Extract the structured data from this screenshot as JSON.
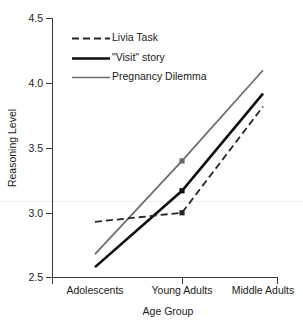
{
  "chart_data": {
    "type": "line",
    "title": "",
    "xlabel": "Age Group",
    "ylabel": "Reasoning Level",
    "categories": [
      "Adolescents",
      "Young Adults",
      "Middle Adults"
    ],
    "ylim": [
      2.5,
      4.5
    ],
    "yticks": [
      "2.5",
      "3.0",
      "3.5",
      "4.0",
      "4.5"
    ],
    "ytick_values": [
      2.5,
      3.0,
      3.5,
      4.0,
      4.5
    ],
    "grid": false,
    "legend_position": "upper left",
    "series": [
      {
        "name": "Livia Task",
        "style": "dashed",
        "color": "#262626",
        "width": 1.8,
        "markers": true,
        "values": [
          2.93,
          3.0,
          3.82
        ]
      },
      {
        "name": "\"Visit\" story",
        "style": "solid",
        "color": "#0d0d0d",
        "width": 2.6,
        "markers": true,
        "values": [
          2.58,
          3.17,
          3.92
        ]
      },
      {
        "name": "Pregnancy Dilemma",
        "style": "solid",
        "color": "#6b6b6b",
        "width": 1.7,
        "markers": true,
        "values": [
          2.68,
          3.4,
          4.1
        ]
      }
    ]
  },
  "axes": {
    "y_title": "Reasoning Level",
    "x_title": "Age Group",
    "y_tick_labels": [
      "4.5",
      "4.0",
      "3.5",
      "3.0",
      "2.5"
    ],
    "x_tick_labels": [
      "Adolescents",
      "Young Adults",
      "Middle Adults"
    ]
  },
  "legend": {
    "items": [
      {
        "label": "Livia Task"
      },
      {
        "label": "\"Visit\" story"
      },
      {
        "label": "Pregnancy Dilemma"
      }
    ]
  }
}
